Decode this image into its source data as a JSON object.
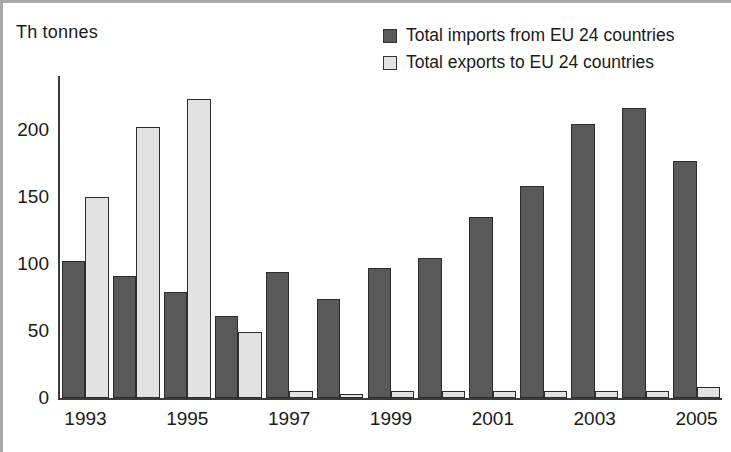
{
  "chart_data": {
    "type": "bar",
    "title": "",
    "subtitle": "",
    "xlabel": "",
    "ylabel": "Th tonnes",
    "ylim": [
      0,
      240
    ],
    "yticks": [
      0,
      50,
      100,
      150,
      200
    ],
    "ytick_labels": [
      "0",
      "50",
      "100",
      "150",
      "200"
    ],
    "grid": false,
    "legend_position": "top-right",
    "categories": [
      "1993",
      "1994",
      "1995",
      "1996",
      "1997",
      "1998",
      "1999",
      "2000",
      "2001",
      "2002",
      "2003",
      "2004",
      "2005"
    ],
    "xtick_labels": [
      "1993",
      "",
      "1995",
      "",
      "1997",
      "",
      "1999",
      "",
      "2001",
      "",
      "2003",
      "",
      "2005"
    ],
    "series": [
      {
        "name": "Total imports from EU 24 countries",
        "color": "#595959",
        "values": [
          102,
          91,
          79,
          61,
          94,
          74,
          97,
          104,
          135,
          158,
          204,
          216,
          177
        ]
      },
      {
        "name": "Total exports to EU 24 countries",
        "color": "#e2e2e2",
        "values": [
          150,
          202,
          223,
          49,
          5,
          3,
          5,
          5,
          5,
          5,
          5,
          5,
          8
        ]
      }
    ]
  },
  "axis": {
    "unit_label": "Th tonnes"
  },
  "legend": {
    "items": [
      {
        "label": "Total imports from EU 24 countries",
        "swatch": "dark"
      },
      {
        "label": "Total exports to EU 24 countries",
        "swatch": "light"
      }
    ]
  }
}
